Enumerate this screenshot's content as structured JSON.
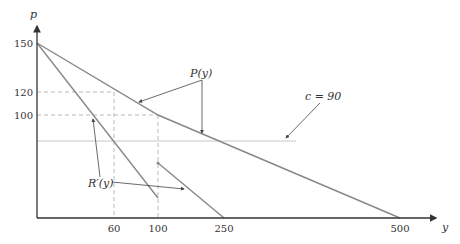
{
  "axes": {
    "y_label": "p",
    "x_label": "y",
    "y_ticks": [
      "150",
      "120",
      "100"
    ],
    "x_ticks": [
      "60",
      "100",
      "250",
      "500"
    ]
  },
  "labels": {
    "demand": "P(y)",
    "marginal_revenue": "R′(y)",
    "cost": "c = 90"
  },
  "colors": {
    "curve": "#888888",
    "axis": "#333333",
    "dashed": "#bbbbbb",
    "cost_line": "#bbbbbb",
    "annotation": "#444444"
  }
}
